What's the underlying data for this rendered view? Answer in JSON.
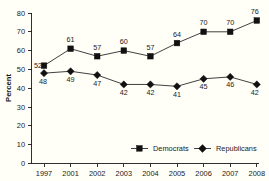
{
  "chart_data": {
    "type": "line",
    "title": "",
    "subtitle": "",
    "xlabel": "",
    "ylabel": "Percent",
    "categories": [
      "1997",
      "2001",
      "2002",
      "2003",
      "2004",
      "2005",
      "2006",
      "2007",
      "2008"
    ],
    "ylim": [
      0,
      80
    ],
    "ytick_step": 10,
    "yticks": [
      "0",
      "10",
      "20",
      "30",
      "40",
      "50",
      "60",
      "70",
      "80"
    ],
    "grid": false,
    "legend_position": "inside-bottom-center",
    "series": [
      {
        "name": "Democrats",
        "marker": "square",
        "color": "#111111",
        "values": [
          52,
          61,
          57,
          60,
          57,
          64,
          70,
          70,
          76
        ],
        "label_position": "above"
      },
      {
        "name": "Republicans",
        "marker": "diamond",
        "color": "#111111",
        "values": [
          48,
          49,
          47,
          42,
          42,
          41,
          45,
          46,
          42
        ],
        "label_position": "below"
      }
    ]
  },
  "chart": {
    "ylabel": "Percent",
    "yticks": [
      "80",
      "70",
      "60",
      "50",
      "40",
      "30",
      "20",
      "10",
      "0"
    ],
    "xticks": [
      "1997",
      "2001",
      "2002",
      "2003",
      "2004",
      "2005",
      "2006",
      "2007",
      "2008"
    ],
    "legend": [
      {
        "label": "Democrats",
        "marker": "square"
      },
      {
        "label": "Republicans",
        "marker": "diamond"
      }
    ],
    "democrats_labels": [
      "52",
      "61",
      "57",
      "60",
      "57",
      "64",
      "70",
      "70",
      "76"
    ],
    "republicans_labels": [
      "48",
      "49",
      "47",
      "42",
      "42",
      "41",
      "45",
      "46",
      "42"
    ]
  }
}
